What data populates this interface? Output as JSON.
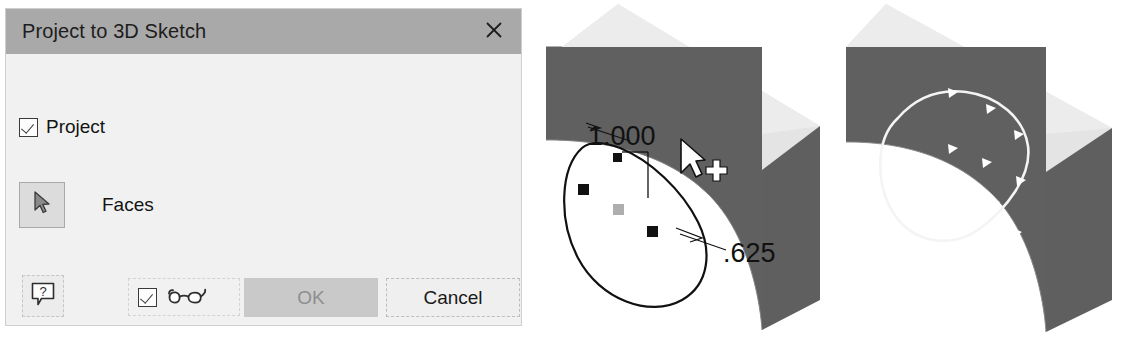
{
  "dialog": {
    "title": "Project to 3D Sketch",
    "close_icon": "close-icon",
    "project_checkbox": {
      "label": "Project",
      "checked": true
    },
    "faces_selector": {
      "label": "Faces",
      "icon": "cursor-arrow-icon"
    },
    "help_button": {
      "icon": "help-balloon-icon",
      "label": "?"
    },
    "preview_toggle": {
      "icon": "glasses-icon",
      "checked": true
    },
    "ok_button": {
      "label": "OK",
      "enabled": false
    },
    "cancel_button": {
      "label": "Cancel",
      "enabled": true
    },
    "colors": {
      "titlebar": "#a9a9a9",
      "body": "#f1f1f1",
      "ok_fill": "#c9c9c9",
      "ok_text": "#8e8e8e",
      "cancel_fill": "#efefef"
    }
  },
  "viewport_left": {
    "name": "3d-view-before-projection",
    "dimensions": [
      {
        "value": "1.000",
        "x": 588,
        "y": 136
      },
      {
        "value": ".625",
        "x": 723,
        "y": 251
      }
    ],
    "cursor": "arrow-cursor-with-crosshair",
    "curve_color": "#111111",
    "face_color": "#606060",
    "top_color": "#e2e2e2",
    "control_points": 4
  },
  "viewport_right": {
    "name": "3d-view-after-projection",
    "curve_color": "#f2f2f2",
    "face_color": "#606060",
    "top_color": "#e2e2e2",
    "marker_count": 9
  }
}
